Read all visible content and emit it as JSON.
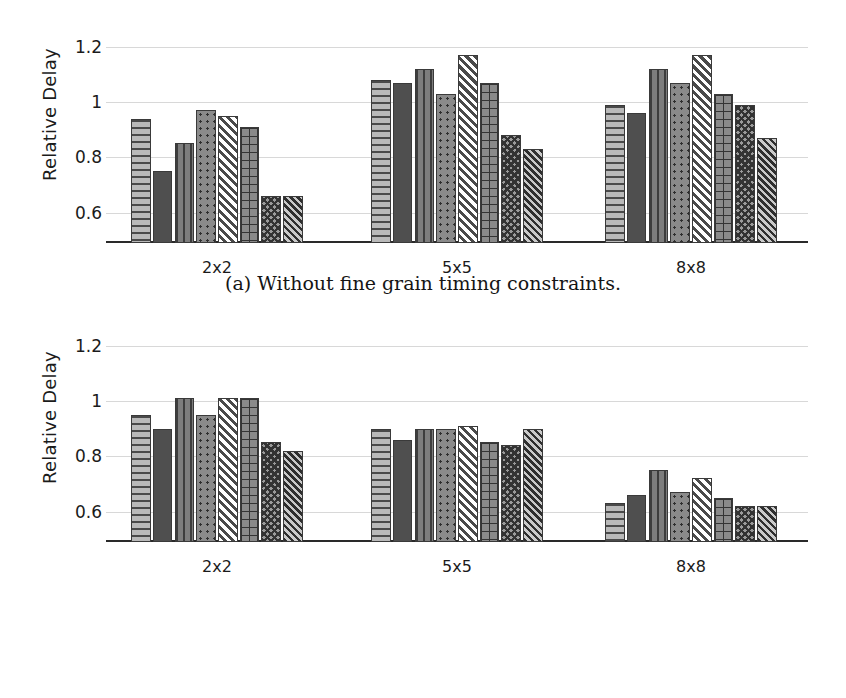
{
  "figure": {
    "subfigures": [
      {
        "id": "a",
        "caption": "(a) Without fine grain timing constraints."
      },
      {
        "id": "b",
        "caption": "(b) With fine grain timing constraints."
      }
    ]
  },
  "legend": {
    "position": "bottom-center",
    "entries": [
      {
        "label": "Basic",
        "pattern": "horizontal-lines"
      },
      {
        "label": "Basic Rectangle",
        "pattern": "solid-dark"
      },
      {
        "label": "Partially Nested",
        "pattern": "vertical-lines"
      },
      {
        "label": "Partially Nested Rectangle",
        "pattern": "dots"
      },
      {
        "label": "Fully Nested",
        "pattern": "diagonal-stripes"
      },
      {
        "label": "Fully Nested Rectangle",
        "pattern": "grid"
      },
      {
        "label": "Manual Variant 1",
        "pattern": "crosshatch"
      },
      {
        "label": "Manual Variant 2",
        "pattern": "dense-diagonal"
      }
    ]
  },
  "chart_data": [
    {
      "id": "a",
      "type": "bar",
      "title": "",
      "subtitle": "(a) Without fine grain timing constraints.",
      "xlabel": "",
      "ylabel": "Relative Delay",
      "categories": [
        "2x2",
        "5x5",
        "8x8"
      ],
      "yticks": [
        "0.6",
        "0.8",
        "1",
        "1.2"
      ],
      "ytick_values": [
        0.6,
        0.8,
        1.0,
        1.2
      ],
      "ylim": [
        0.49,
        1.26
      ],
      "grid": true,
      "legend_position": "bottom",
      "series": [
        {
          "name": "Basic",
          "values": [
            0.94,
            1.08,
            0.99
          ]
        },
        {
          "name": "Basic Rectangle",
          "values": [
            0.75,
            1.07,
            0.96
          ]
        },
        {
          "name": "Partially Nested",
          "values": [
            0.85,
            1.12,
            1.12
          ]
        },
        {
          "name": "Partially Nested Rectangle",
          "values": [
            0.97,
            1.03,
            1.07
          ]
        },
        {
          "name": "Fully Nested",
          "values": [
            0.95,
            1.17,
            1.17
          ]
        },
        {
          "name": "Fully Nested Rectangle",
          "values": [
            0.91,
            1.07,
            1.03
          ]
        },
        {
          "name": "Manual Variant 1",
          "values": [
            0.66,
            0.88,
            0.99
          ]
        },
        {
          "name": "Manual Variant 2",
          "values": [
            0.66,
            0.83,
            0.87
          ]
        }
      ]
    },
    {
      "id": "b",
      "type": "bar",
      "title": "",
      "subtitle": "(b) With fine grain timing constraints.",
      "xlabel": "",
      "ylabel": "Relative Delay",
      "categories": [
        "2x2",
        "5x5",
        "8x8"
      ],
      "yticks": [
        "0.6",
        "0.8",
        "1",
        "1.2"
      ],
      "ytick_values": [
        0.6,
        0.8,
        1.0,
        1.2
      ],
      "ylim": [
        0.49,
        1.26
      ],
      "grid": true,
      "legend_position": "bottom",
      "series": [
        {
          "name": "Basic",
          "values": [
            0.95,
            0.9,
            0.63
          ]
        },
        {
          "name": "Basic Rectangle",
          "values": [
            0.9,
            0.86,
            0.66
          ]
        },
        {
          "name": "Partially Nested",
          "values": [
            1.01,
            0.9,
            0.75
          ]
        },
        {
          "name": "Partially Nested Rectangle",
          "values": [
            0.95,
            0.9,
            0.67
          ]
        },
        {
          "name": "Fully Nested",
          "values": [
            1.01,
            0.91,
            0.72
          ]
        },
        {
          "name": "Fully Nested Rectangle",
          "values": [
            1.01,
            0.85,
            0.65
          ]
        },
        {
          "name": "Manual Variant 1",
          "values": [
            0.85,
            0.84,
            0.62
          ]
        },
        {
          "name": "Manual Variant 2",
          "values": [
            0.82,
            0.9,
            0.62
          ]
        }
      ]
    }
  ]
}
